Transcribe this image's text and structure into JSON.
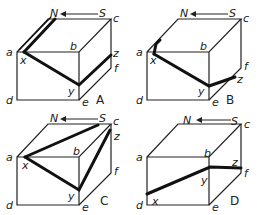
{
  "figure": {
    "panels": [
      {
        "id": "A",
        "caption": "A",
        "path_desc": "thick line from x up along top-left edge to N, and x to y, y to z"
      },
      {
        "id": "B",
        "caption": "B",
        "path_desc": "short thick segment up from x, x to y, y to z"
      },
      {
        "id": "C",
        "caption": "C",
        "path_desc": "x to near c, x to y, y to z"
      },
      {
        "id": "D",
        "caption": "D",
        "path_desc": "x to y, y to z"
      }
    ],
    "vertex_labels": {
      "a": "a",
      "b": "b",
      "c": "c",
      "d": "d",
      "e": "e",
      "f": "f",
      "x": "x",
      "y": "y",
      "z": "z"
    },
    "compass": {
      "north": "N",
      "south": "S",
      "arrow": "←"
    },
    "colors": {
      "line": "#222222",
      "thick": "#111111",
      "background": "#ffffff"
    }
  }
}
